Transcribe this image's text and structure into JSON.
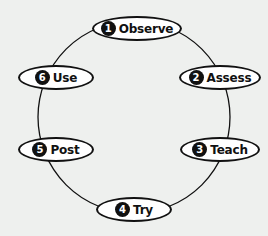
{
  "diagram": {
    "type": "cycle",
    "background_color": "#eef0ee",
    "stroke_color": "#111111",
    "node_fill": "#ffffff",
    "steps": [
      {
        "number": "1",
        "label": "Observe"
      },
      {
        "number": "2",
        "label": "Assess"
      },
      {
        "number": "3",
        "label": "Teach"
      },
      {
        "number": "4",
        "label": "Try"
      },
      {
        "number": "5",
        "label": "Post"
      },
      {
        "number": "6",
        "label": "Use"
      }
    ]
  }
}
